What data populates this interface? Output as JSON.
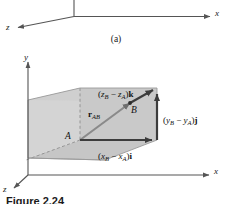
{
  "figure": {
    "number": "Figure  2.24",
    "panel_a_caption": "(a)",
    "panel_b": {
      "axes": {
        "y_label": "y",
        "x_label": "x",
        "z_label": "z"
      },
      "points": {
        "a": "A",
        "b": "B"
      },
      "vector_label": {
        "symbol": "r",
        "subscript": "AB"
      },
      "components": {
        "z_component": {
          "open": "(",
          "var1": "z",
          "sub1": "B",
          "minus": " − ",
          "var2": "z",
          "sub2": "A",
          "close": ")",
          "unit": "k"
        },
        "y_component": {
          "open": "(",
          "var1": "y",
          "sub1": "B",
          "minus": " − ",
          "var2": "y",
          "sub2": "A",
          "close": ")",
          "unit": "j"
        },
        "x_component": {
          "open": "(",
          "var1": "x",
          "sub1": "B",
          "minus": " − ",
          "var2": "x",
          "sub2": "A",
          "close": ")",
          "unit": "i"
        }
      }
    },
    "panel_a": {
      "axes": {
        "x_label": "x",
        "z_label": "z"
      }
    }
  },
  "colors": {
    "ink": "#1a1a1a",
    "axis": "#555555",
    "arrow": "#3c3c3c",
    "box_face_light": "#d2d2d2",
    "box_face_mid": "#c2c2c2",
    "box_face_dark": "#b5b5b5",
    "dashed": "#8a8a8a",
    "background": "#ffffff"
  }
}
